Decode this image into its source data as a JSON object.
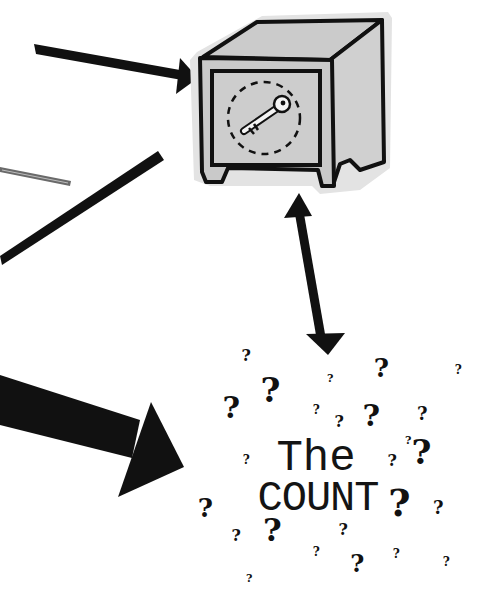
{
  "illustration": {
    "title_line1": "The",
    "title_line2": "COUNT",
    "question_mark": "?",
    "safe": {
      "label": "safe-with-key",
      "fill": "#cfcfcf",
      "shadow": "#e2e2e2",
      "stroke": "#111111"
    },
    "arrow_color": "#111111",
    "stray_line_color": "#6a6a6a",
    "question_marks": [
      {
        "x": 246,
        "y": 356,
        "size": 16
      },
      {
        "x": 330,
        "y": 378,
        "size": 11
      },
      {
        "x": 381,
        "y": 368,
        "size": 26
      },
      {
        "x": 458,
        "y": 370,
        "size": 12
      },
      {
        "x": 270,
        "y": 390,
        "size": 34
      },
      {
        "x": 231,
        "y": 408,
        "size": 30
      },
      {
        "x": 316,
        "y": 410,
        "size": 12
      },
      {
        "x": 339,
        "y": 422,
        "size": 16
      },
      {
        "x": 371,
        "y": 416,
        "size": 30
      },
      {
        "x": 422,
        "y": 414,
        "size": 18
      },
      {
        "x": 408,
        "y": 440,
        "size": 11
      },
      {
        "x": 246,
        "y": 460,
        "size": 12
      },
      {
        "x": 392,
        "y": 461,
        "size": 16
      },
      {
        "x": 421,
        "y": 452,
        "size": 34
      },
      {
        "x": 205,
        "y": 508,
        "size": 26
      },
      {
        "x": 399,
        "y": 503,
        "size": 38
      },
      {
        "x": 438,
        "y": 508,
        "size": 18
      },
      {
        "x": 236,
        "y": 536,
        "size": 16
      },
      {
        "x": 272,
        "y": 530,
        "size": 32
      },
      {
        "x": 343,
        "y": 530,
        "size": 16
      },
      {
        "x": 316,
        "y": 552,
        "size": 12
      },
      {
        "x": 396,
        "y": 554,
        "size": 12
      },
      {
        "x": 446,
        "y": 562,
        "size": 12
      },
      {
        "x": 357,
        "y": 564,
        "size": 24
      },
      {
        "x": 249,
        "y": 578,
        "size": 11
      }
    ]
  }
}
